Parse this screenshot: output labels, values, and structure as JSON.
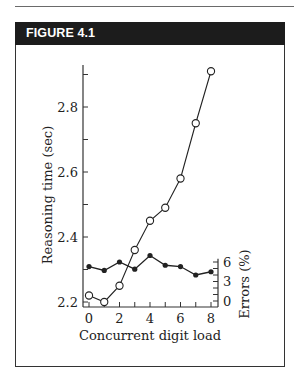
{
  "figure": {
    "label": "FIGURE 4.1"
  },
  "chart_data": {
    "type": "line",
    "title": "",
    "xlabel": "Concurrent digit load",
    "ylabel": "Reasoning time (sec)",
    "ylabel_right": "Errors (%)",
    "x": [
      0,
      1,
      2,
      3,
      4,
      5,
      6,
      7,
      8
    ],
    "x_ticks": [
      0,
      2,
      4,
      6,
      8
    ],
    "x_tick_labels": [
      "0",
      "2",
      "4",
      "6",
      "8"
    ],
    "xlim": [
      0,
      8
    ],
    "ylim": [
      2.2,
      2.9
    ],
    "y_ticks": [
      2.2,
      2.3,
      2.4,
      2.5,
      2.6,
      2.7,
      2.8,
      2.9
    ],
    "y_tick_labels": [
      "2.2",
      "2.4",
      "2.6",
      "2.8"
    ],
    "ylim_right": [
      0,
      6
    ],
    "y_right_ticks": [
      0,
      1,
      2,
      3,
      4,
      5,
      6
    ],
    "y_right_tick_labels": [
      "0",
      "3",
      "6"
    ],
    "grid": false,
    "legend": "none",
    "series": [
      {
        "name": "Reasoning time",
        "axis": "left",
        "marker": "open-circle",
        "values": [
          2.22,
          2.2,
          2.25,
          2.36,
          2.45,
          2.49,
          2.58,
          2.75,
          2.91
        ]
      },
      {
        "name": "Errors",
        "axis": "right",
        "marker": "filled-circle",
        "values": [
          5.3,
          4.7,
          6.0,
          4.9,
          7.0,
          5.5,
          5.3,
          4.0,
          4.5
        ]
      }
    ]
  }
}
